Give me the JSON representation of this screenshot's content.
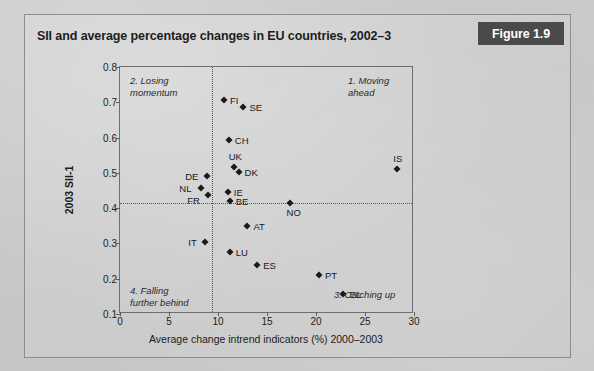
{
  "figure": {
    "title": "SII and average percentage changes in EU countries, 2002–3",
    "tag": "Figure 1.9"
  },
  "chart_data": {
    "type": "scatter",
    "title": "SII and average percentage changes in EU countries, 2002–3",
    "xlabel": "Average change intrend indicators (%)   2000–2003",
    "ylabel": "2003 SII-1",
    "xlim": [
      0,
      30
    ],
    "ylim": [
      0.1,
      0.8
    ],
    "xticks": [
      "0",
      "5",
      "10",
      "15",
      "20",
      "25",
      "30"
    ],
    "yticks": [
      "0.1",
      "0.2",
      "0.3",
      "0.4",
      "0.5",
      "0.6",
      "0.7",
      "0.8"
    ],
    "grid": "reference-lines-only",
    "legend": "none",
    "reference_lines": {
      "vertical_x": 9.4,
      "horizontal_y": 0.415
    },
    "quadrant_labels": [
      {
        "id": "q1",
        "text": "1.  Moving ahead"
      },
      {
        "id": "q2",
        "text": "2. Losing\nmomentum"
      },
      {
        "id": "q3",
        "text": "3. Catching up"
      },
      {
        "id": "q4",
        "text": "4. Falling\nfurther behind"
      }
    ],
    "points": [
      {
        "label": "FI",
        "x": 10.6,
        "y": 0.706,
        "lx": 6,
        "ly": -5
      },
      {
        "label": "SE",
        "x": 12.6,
        "y": 0.686,
        "lx": 6,
        "ly": -5
      },
      {
        "label": "CH",
        "x": 11.1,
        "y": 0.593,
        "lx": 6,
        "ly": -5
      },
      {
        "label": "UK",
        "x": 11.6,
        "y": 0.517,
        "lx": -5,
        "ly": -16
      },
      {
        "label": "DK",
        "x": 12.1,
        "y": 0.503,
        "lx": 6,
        "ly": -5
      },
      {
        "label": "DE",
        "x": 8.9,
        "y": 0.492,
        "lx": -22,
        "ly": -5
      },
      {
        "label": "NL",
        "x": 8.3,
        "y": 0.458,
        "lx": -22,
        "ly": -5
      },
      {
        "label": "FR",
        "x": 9.0,
        "y": 0.438,
        "lx": -21,
        "ly": 0
      },
      {
        "label": "IE",
        "x": 11.0,
        "y": 0.445,
        "lx": 6,
        "ly": -5
      },
      {
        "label": "BE",
        "x": 11.2,
        "y": 0.42,
        "lx": 6,
        "ly": -5
      },
      {
        "label": "NO",
        "x": 17.3,
        "y": 0.415,
        "lx": -3,
        "ly": 4
      },
      {
        "label": "IS",
        "x": 28.3,
        "y": 0.512,
        "lx": -4,
        "ly": -16
      },
      {
        "label": "AT",
        "x": 13.0,
        "y": 0.35,
        "lx": 6,
        "ly": -5
      },
      {
        "label": "IT",
        "x": 8.7,
        "y": 0.305,
        "lx": -17,
        "ly": -5
      },
      {
        "label": "LU",
        "x": 11.2,
        "y": 0.275,
        "lx": 6,
        "ly": -5
      },
      {
        "label": "ES",
        "x": 14.0,
        "y": 0.24,
        "lx": 6,
        "ly": -5
      },
      {
        "label": "PT",
        "x": 20.3,
        "y": 0.21,
        "lx": 6,
        "ly": -5
      },
      {
        "label": "EL",
        "x": 22.8,
        "y": 0.158,
        "lx": 6,
        "ly": -5
      }
    ]
  },
  "colors": {
    "marker": "#1a1a1a",
    "tag_background": "#4a4a4a",
    "tag_text": "#ffffff",
    "axis": "#6f6f6f",
    "card_background": "#cdcdcd"
  }
}
